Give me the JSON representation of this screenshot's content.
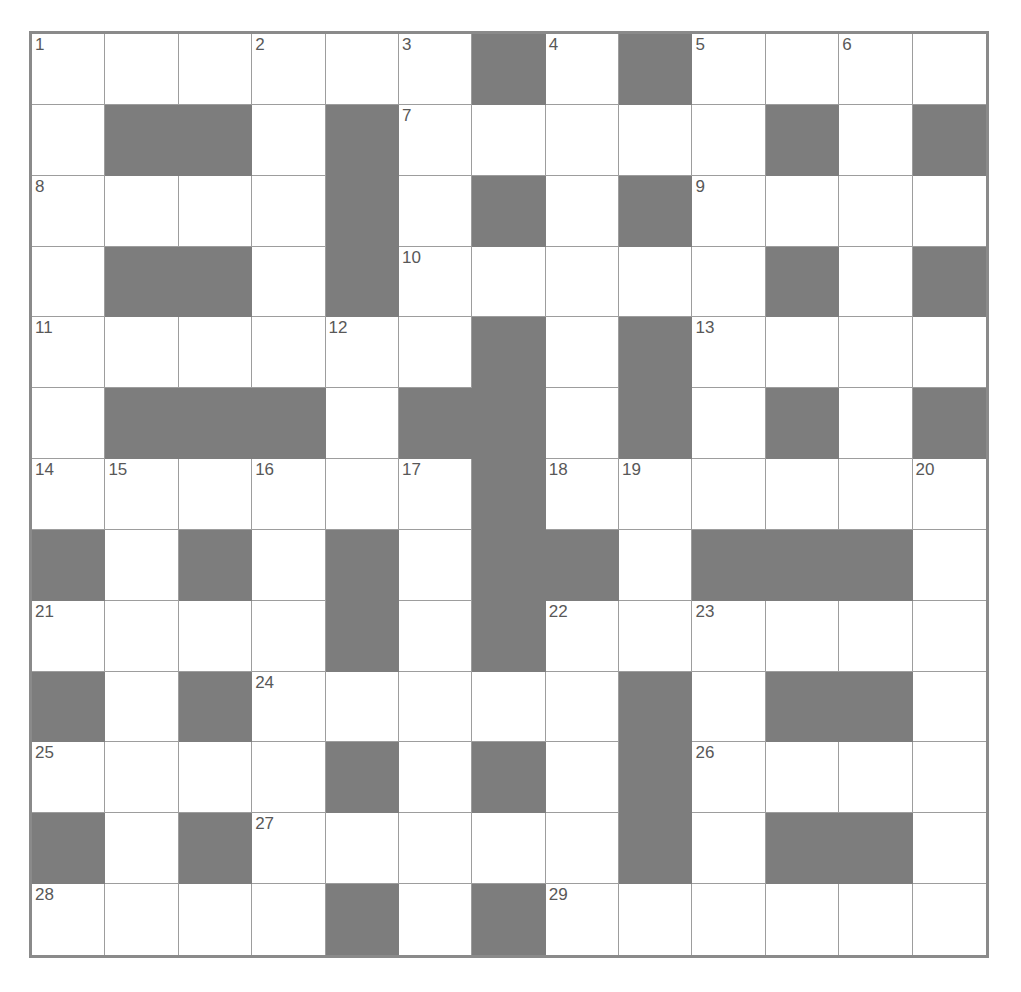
{
  "puzzle": {
    "title": "Crossword Grid",
    "type": "crossword",
    "columns": 13,
    "rows": 13,
    "colors": {
      "blocked_cell": "#7d7d7d",
      "open_cell": "#ffffff",
      "grid_line": "#9d9d9d",
      "outer_border": "#8a8a8a",
      "clue_number": "#585858",
      "page_background": "#ffffff"
    },
    "highest_clue_number": 29,
    "clue_numbers_visible": [
      1,
      2,
      3,
      4,
      5,
      6,
      7,
      8,
      9,
      10,
      11,
      12,
      13,
      14,
      15,
      16,
      17,
      18,
      19,
      20,
      21,
      22,
      23,
      24,
      25,
      26,
      27,
      28,
      29
    ],
    "grid": [
      [
        {
          "blocked": false,
          "number": "1"
        },
        {
          "blocked": false,
          "number": ""
        },
        {
          "blocked": false,
          "number": ""
        },
        {
          "blocked": false,
          "number": "2"
        },
        {
          "blocked": false,
          "number": ""
        },
        {
          "blocked": false,
          "number": "3"
        },
        {
          "blocked": true,
          "number": ""
        },
        {
          "blocked": false,
          "number": "4"
        },
        {
          "blocked": true,
          "number": ""
        },
        {
          "blocked": false,
          "number": "5"
        },
        {
          "blocked": false,
          "number": ""
        },
        {
          "blocked": false,
          "number": "6"
        },
        {
          "blocked": false,
          "number": ""
        }
      ],
      [
        {
          "blocked": false,
          "number": ""
        },
        {
          "blocked": true,
          "number": ""
        },
        {
          "blocked": true,
          "number": ""
        },
        {
          "blocked": false,
          "number": ""
        },
        {
          "blocked": true,
          "number": ""
        },
        {
          "blocked": false,
          "number": "7"
        },
        {
          "blocked": false,
          "number": ""
        },
        {
          "blocked": false,
          "number": ""
        },
        {
          "blocked": false,
          "number": ""
        },
        {
          "blocked": false,
          "number": ""
        },
        {
          "blocked": true,
          "number": ""
        },
        {
          "blocked": false,
          "number": ""
        },
        {
          "blocked": true,
          "number": ""
        }
      ],
      [
        {
          "blocked": false,
          "number": "8"
        },
        {
          "blocked": false,
          "number": ""
        },
        {
          "blocked": false,
          "number": ""
        },
        {
          "blocked": false,
          "number": ""
        },
        {
          "blocked": true,
          "number": ""
        },
        {
          "blocked": false,
          "number": ""
        },
        {
          "blocked": true,
          "number": ""
        },
        {
          "blocked": false,
          "number": ""
        },
        {
          "blocked": true,
          "number": ""
        },
        {
          "blocked": false,
          "number": "9"
        },
        {
          "blocked": false,
          "number": ""
        },
        {
          "blocked": false,
          "number": ""
        },
        {
          "blocked": false,
          "number": ""
        }
      ],
      [
        {
          "blocked": false,
          "number": ""
        },
        {
          "blocked": true,
          "number": ""
        },
        {
          "blocked": true,
          "number": ""
        },
        {
          "blocked": false,
          "number": ""
        },
        {
          "blocked": true,
          "number": ""
        },
        {
          "blocked": false,
          "number": "10"
        },
        {
          "blocked": false,
          "number": ""
        },
        {
          "blocked": false,
          "number": ""
        },
        {
          "blocked": false,
          "number": ""
        },
        {
          "blocked": false,
          "number": ""
        },
        {
          "blocked": true,
          "number": ""
        },
        {
          "blocked": false,
          "number": ""
        },
        {
          "blocked": true,
          "number": ""
        }
      ],
      [
        {
          "blocked": false,
          "number": "11"
        },
        {
          "blocked": false,
          "number": ""
        },
        {
          "blocked": false,
          "number": ""
        },
        {
          "blocked": false,
          "number": ""
        },
        {
          "blocked": false,
          "number": "12"
        },
        {
          "blocked": false,
          "number": ""
        },
        {
          "blocked": true,
          "number": ""
        },
        {
          "blocked": false,
          "number": ""
        },
        {
          "blocked": true,
          "number": ""
        },
        {
          "blocked": false,
          "number": "13"
        },
        {
          "blocked": false,
          "number": ""
        },
        {
          "blocked": false,
          "number": ""
        },
        {
          "blocked": false,
          "number": ""
        }
      ],
      [
        {
          "blocked": false,
          "number": ""
        },
        {
          "blocked": true,
          "number": ""
        },
        {
          "blocked": true,
          "number": ""
        },
        {
          "blocked": true,
          "number": ""
        },
        {
          "blocked": false,
          "number": ""
        },
        {
          "blocked": true,
          "number": ""
        },
        {
          "blocked": true,
          "number": ""
        },
        {
          "blocked": false,
          "number": ""
        },
        {
          "blocked": true,
          "number": ""
        },
        {
          "blocked": false,
          "number": ""
        },
        {
          "blocked": true,
          "number": ""
        },
        {
          "blocked": false,
          "number": ""
        },
        {
          "blocked": true,
          "number": ""
        }
      ],
      [
        {
          "blocked": false,
          "number": "14"
        },
        {
          "blocked": false,
          "number": "15"
        },
        {
          "blocked": false,
          "number": ""
        },
        {
          "blocked": false,
          "number": "16"
        },
        {
          "blocked": false,
          "number": ""
        },
        {
          "blocked": false,
          "number": "17"
        },
        {
          "blocked": true,
          "number": ""
        },
        {
          "blocked": false,
          "number": "18"
        },
        {
          "blocked": false,
          "number": "19"
        },
        {
          "blocked": false,
          "number": ""
        },
        {
          "blocked": false,
          "number": ""
        },
        {
          "blocked": false,
          "number": ""
        },
        {
          "blocked": false,
          "number": "20"
        }
      ],
      [
        {
          "blocked": true,
          "number": ""
        },
        {
          "blocked": false,
          "number": ""
        },
        {
          "blocked": true,
          "number": ""
        },
        {
          "blocked": false,
          "number": ""
        },
        {
          "blocked": true,
          "number": ""
        },
        {
          "blocked": false,
          "number": ""
        },
        {
          "blocked": true,
          "number": ""
        },
        {
          "blocked": true,
          "number": ""
        },
        {
          "blocked": false,
          "number": ""
        },
        {
          "blocked": true,
          "number": ""
        },
        {
          "blocked": true,
          "number": ""
        },
        {
          "blocked": true,
          "number": ""
        },
        {
          "blocked": false,
          "number": ""
        }
      ],
      [
        {
          "blocked": false,
          "number": "21"
        },
        {
          "blocked": false,
          "number": ""
        },
        {
          "blocked": false,
          "number": ""
        },
        {
          "blocked": false,
          "number": ""
        },
        {
          "blocked": true,
          "number": ""
        },
        {
          "blocked": false,
          "number": ""
        },
        {
          "blocked": true,
          "number": ""
        },
        {
          "blocked": false,
          "number": "22"
        },
        {
          "blocked": false,
          "number": ""
        },
        {
          "blocked": false,
          "number": "23"
        },
        {
          "blocked": false,
          "number": ""
        },
        {
          "blocked": false,
          "number": ""
        },
        {
          "blocked": false,
          "number": ""
        }
      ],
      [
        {
          "blocked": true,
          "number": ""
        },
        {
          "blocked": false,
          "number": ""
        },
        {
          "blocked": true,
          "number": ""
        },
        {
          "blocked": false,
          "number": "24"
        },
        {
          "blocked": false,
          "number": ""
        },
        {
          "blocked": false,
          "number": ""
        },
        {
          "blocked": false,
          "number": ""
        },
        {
          "blocked": false,
          "number": ""
        },
        {
          "blocked": true,
          "number": ""
        },
        {
          "blocked": false,
          "number": ""
        },
        {
          "blocked": true,
          "number": ""
        },
        {
          "blocked": true,
          "number": ""
        },
        {
          "blocked": false,
          "number": ""
        }
      ],
      [
        {
          "blocked": false,
          "number": "25"
        },
        {
          "blocked": false,
          "number": ""
        },
        {
          "blocked": false,
          "number": ""
        },
        {
          "blocked": false,
          "number": ""
        },
        {
          "blocked": true,
          "number": ""
        },
        {
          "blocked": false,
          "number": ""
        },
        {
          "blocked": true,
          "number": ""
        },
        {
          "blocked": false,
          "number": ""
        },
        {
          "blocked": true,
          "number": ""
        },
        {
          "blocked": false,
          "number": "26"
        },
        {
          "blocked": false,
          "number": ""
        },
        {
          "blocked": false,
          "number": ""
        },
        {
          "blocked": false,
          "number": ""
        }
      ],
      [
        {
          "blocked": true,
          "number": ""
        },
        {
          "blocked": false,
          "number": ""
        },
        {
          "blocked": true,
          "number": ""
        },
        {
          "blocked": false,
          "number": "27"
        },
        {
          "blocked": false,
          "number": ""
        },
        {
          "blocked": false,
          "number": ""
        },
        {
          "blocked": false,
          "number": ""
        },
        {
          "blocked": false,
          "number": ""
        },
        {
          "blocked": true,
          "number": ""
        },
        {
          "blocked": false,
          "number": ""
        },
        {
          "blocked": true,
          "number": ""
        },
        {
          "blocked": true,
          "number": ""
        },
        {
          "blocked": false,
          "number": ""
        }
      ],
      [
        {
          "blocked": false,
          "number": "28"
        },
        {
          "blocked": false,
          "number": ""
        },
        {
          "blocked": false,
          "number": ""
        },
        {
          "blocked": false,
          "number": ""
        },
        {
          "blocked": true,
          "number": ""
        },
        {
          "blocked": false,
          "number": ""
        },
        {
          "blocked": true,
          "number": ""
        },
        {
          "blocked": false,
          "number": "29"
        },
        {
          "blocked": false,
          "number": ""
        },
        {
          "blocked": false,
          "number": ""
        },
        {
          "blocked": false,
          "number": ""
        },
        {
          "blocked": false,
          "number": ""
        },
        {
          "blocked": false,
          "number": ""
        }
      ]
    ]
  }
}
